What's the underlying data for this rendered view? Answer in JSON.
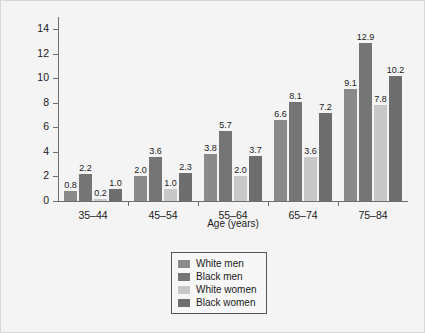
{
  "chart_data": {
    "type": "bar",
    "title": "",
    "xlabel": "Age (years)",
    "ylabel": "Per 1,000 Person Years",
    "categories": [
      "35–44",
      "45–54",
      "55–64",
      "65–74",
      "75–84"
    ],
    "series": [
      {
        "name": "White men",
        "color": "#8a8a8a",
        "values": [
          0.8,
          2.0,
          3.8,
          6.6,
          9.1
        ]
      },
      {
        "name": "Black men",
        "color": "#757575",
        "values": [
          2.2,
          3.6,
          5.7,
          8.1,
          12.9
        ]
      },
      {
        "name": "White women",
        "color": "#c8c8c8",
        "values": [
          0.2,
          1.0,
          2.0,
          3.6,
          7.8
        ]
      },
      {
        "name": "Black women",
        "color": "#6e6e6e",
        "values": [
          1.0,
          2.3,
          3.7,
          7.2,
          10.2
        ]
      }
    ],
    "ylim": [
      0,
      15
    ],
    "yticks": [
      0,
      2,
      4,
      6,
      8,
      10,
      12,
      14
    ],
    "ytick_labels": [
      "0",
      "2",
      "4",
      "6",
      "8",
      "10",
      "12",
      "14"
    ],
    "grid": false,
    "legend_position": "bottom-center",
    "value_labels": [
      [
        "0.8",
        "2.2",
        "0.2",
        "1.0"
      ],
      [
        "2.0",
        "3.6",
        "1.0",
        "2.3"
      ],
      [
        "3.8",
        "5.7",
        "2.0",
        "3.7"
      ],
      [
        "6.6",
        "8.1",
        "3.6",
        "7.2"
      ],
      [
        "9.1",
        "12.9",
        "7.8",
        "10.2"
      ]
    ]
  },
  "legend": {
    "items": [
      {
        "label": "White men"
      },
      {
        "label": "Black men"
      },
      {
        "label": "White women"
      },
      {
        "label": "Black women"
      }
    ]
  }
}
